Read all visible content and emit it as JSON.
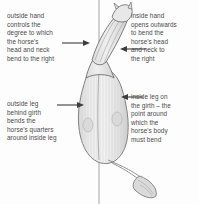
{
  "figure": {
    "view": "horse seen from above, bending to the right around a vertical centre line",
    "background_color": "#fdfdfd",
    "ink_color": "#4a4a4a",
    "line_color": "#6f6f6f",
    "body_fill": "#e9e9e9",
    "centre_line": {
      "name": "vertical-reference-line",
      "x": 99,
      "y_top": 0,
      "y_bottom": 204
    }
  },
  "annotations": [
    {
      "id": "outside-hand",
      "text": "outside hand\ncontrols the\ndegree to which\nthe horse's\nhead and neck\nbend to the right",
      "side": "left",
      "arrow_direction": "right"
    },
    {
      "id": "inside-hand",
      "text": "inside hand\nopens outwards\nto bend the\nhorse's head\nand neck to\nthe right",
      "side": "right",
      "arrow_direction": "left"
    },
    {
      "id": "outside-leg",
      "text": "outside leg\nbehind girth\nbends the\nhorse's quarters\naround inside leg",
      "side": "left",
      "arrow_direction": "right"
    },
    {
      "id": "inside-leg",
      "text": "inside leg on\nthe girth – the\npoint around\nwhich the\nhorse's body\nmust bend",
      "side": "right",
      "arrow_direction": "left"
    }
  ],
  "arrows": [
    {
      "name": "arrow-outside-hand",
      "x1": 62,
      "y1": 43,
      "x2": 88,
      "y2": 43,
      "head": "right"
    },
    {
      "name": "arrow-inside-hand",
      "x1": 146,
      "y1": 49,
      "x2": 122,
      "y2": 49,
      "head": "left"
    },
    {
      "name": "arrow-outside-leg",
      "x1": 57,
      "y1": 105,
      "x2": 83,
      "y2": 105,
      "head": "right"
    },
    {
      "name": "arrow-inside-leg",
      "x1": 143,
      "y1": 97,
      "x2": 123,
      "y2": 97,
      "head": "left"
    }
  ]
}
